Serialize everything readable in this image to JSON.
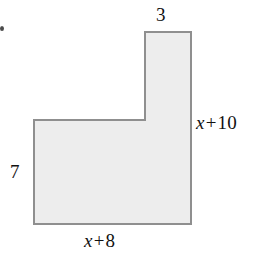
{
  "figure": {
    "name": "l-shaped-polygon",
    "fill_color": "#ededed",
    "stroke_color": "#8f8f8f",
    "background_color": "#ffffff",
    "stroke_width": 2,
    "vertices": [
      [
        145,
        32
      ],
      [
        191,
        32
      ],
      [
        191,
        224
      ],
      [
        34,
        224
      ],
      [
        34,
        120
      ],
      [
        145,
        120
      ]
    ]
  },
  "labels": {
    "top": {
      "text": "3",
      "full_text": "3",
      "edge": "top-edge-of-vertical-arm"
    },
    "right": {
      "variable": "x",
      "operator": "+",
      "constant": "10",
      "full_text": "x + 10",
      "edge": "right-edge"
    },
    "left": {
      "text": "7",
      "full_text": "7",
      "edge": "left-edge"
    },
    "bottom": {
      "variable": "x",
      "operator": "+",
      "constant": "8",
      "full_text": "x + 8",
      "edge": "bottom-edge"
    }
  },
  "chart_data": {
    "type": "diagram",
    "title": "",
    "shape": "L-shaped hexagon (rectilinear polygon)",
    "dimension_labels": [
      "3",
      "x + 10",
      "7",
      "x + 8"
    ]
  }
}
